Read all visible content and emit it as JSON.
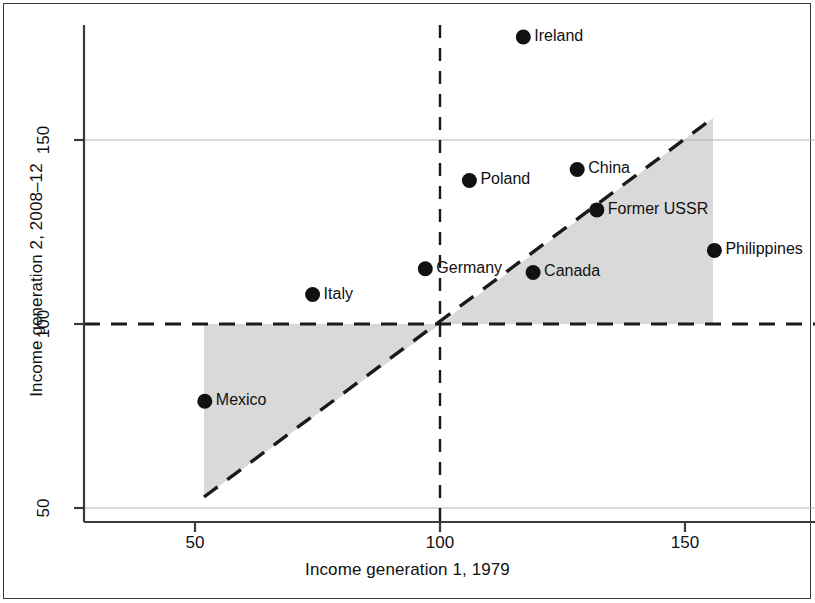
{
  "chart_data": {
    "type": "scatter",
    "title": "",
    "xlabel": "Income generation 1, 1979",
    "ylabel": "Income generation 2, 2008–12",
    "xlim": [
      33,
      172
    ],
    "ylim": [
      43,
      188
    ],
    "x_ticks": [
      50,
      100,
      150
    ],
    "y_ticks": [
      50,
      100,
      150
    ],
    "x_tick_labels": [
      "50",
      "100",
      "150"
    ],
    "y_tick_labels": [
      "50",
      "100",
      "150"
    ],
    "grid": "horizontal gridlines at y=50 and y=150",
    "legend": "none",
    "points": [
      {
        "label": "Ireland",
        "x": 117,
        "y": 178
      },
      {
        "label": "China",
        "x": 128,
        "y": 142
      },
      {
        "label": "Poland",
        "x": 106,
        "y": 139
      },
      {
        "label": "Former USSR",
        "x": 132,
        "y": 131
      },
      {
        "label": "Philippines",
        "x": 156,
        "y": 120
      },
      {
        "label": "Germany",
        "x": 97,
        "y": 115
      },
      {
        "label": "Canada",
        "x": 119,
        "y": 114
      },
      {
        "label": "Italy",
        "x": 74,
        "y": 108
      },
      {
        "label": "Mexico",
        "x": 52,
        "y": 79
      }
    ],
    "reference_lines": [
      {
        "name": "horizontal-100-line",
        "type": "horizontal",
        "value": 100,
        "style": "dashed"
      },
      {
        "name": "vertical-100-line",
        "type": "vertical",
        "value": 100,
        "style": "dashed"
      },
      {
        "name": "identity-line",
        "type": "diagonal",
        "slope": 1,
        "intercept": 0,
        "style": "dashed"
      }
    ],
    "shaded_regions": [
      {
        "name": "lower-left-shaded-wedge",
        "description": "Region between the 45-degree identity line and y=100, for x from 52 to 100",
        "color": "#d9d9d9"
      },
      {
        "name": "upper-right-shaded-wedge",
        "description": "Region between y=100 and the 45-degree identity line, for x from 100 to 156",
        "color": "#d9d9d9"
      }
    ],
    "colors": {
      "marker": "#111111",
      "axis": "#3a3a3a",
      "gridline": "#b4b4b4",
      "shading": "#d9d9d9",
      "background": "#ffffff"
    }
  }
}
